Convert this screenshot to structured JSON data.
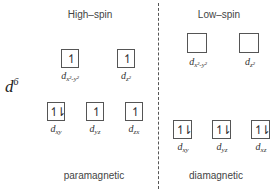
{
  "config_label": {
    "base": "d",
    "superscript": "6"
  },
  "high_spin": {
    "title": "High–spin",
    "magnetism": "paramagnetic",
    "eg": [
      {
        "orbital_base": "d",
        "orbital_sub": "x²-y²",
        "electrons": "↿"
      },
      {
        "orbital_base": "d",
        "orbital_sub": "z²",
        "electrons": "↿"
      }
    ],
    "t2g": [
      {
        "orbital_base": "d",
        "orbital_sub": "xy",
        "electrons": "↿⇂"
      },
      {
        "orbital_base": "d",
        "orbital_sub": "yz",
        "electrons": "↿"
      },
      {
        "orbital_base": "d",
        "orbital_sub": "zx",
        "electrons": "↿"
      }
    ]
  },
  "low_spin": {
    "title": "Low–spin",
    "magnetism": "diamagnetic",
    "eg": [
      {
        "orbital_base": "d",
        "orbital_sub": "x²-y²",
        "electrons": ""
      },
      {
        "orbital_base": "d",
        "orbital_sub": "z²",
        "electrons": ""
      }
    ],
    "t2g": [
      {
        "orbital_base": "d",
        "orbital_sub": "xy",
        "electrons": "↿⇂"
      },
      {
        "orbital_base": "d",
        "orbital_sub": "yz",
        "electrons": "↿⇂"
      },
      {
        "orbital_base": "d",
        "orbital_sub": "xz",
        "electrons": "↿⇂"
      }
    ]
  }
}
